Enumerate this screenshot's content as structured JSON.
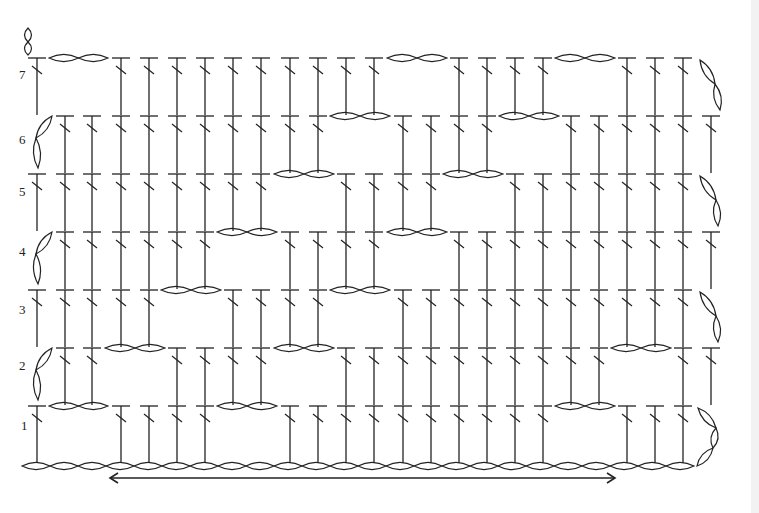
{
  "diagram": {
    "type": "crochet-stitch-chart",
    "stroke_color": "#222222",
    "background": "#ffffff",
    "columns": 25,
    "column_x": [
      37,
      65,
      92,
      121,
      149,
      177,
      205,
      233,
      261,
      290,
      318,
      346,
      374,
      403,
      431,
      459,
      487,
      515,
      543,
      571,
      599,
      627,
      655,
      683,
      711
    ],
    "foundation_chain": {
      "y": 466,
      "loops": 24,
      "x_start": 22,
      "loop_width": 28
    },
    "direction_arrow": {
      "y": 478,
      "x_start": 110,
      "x_end": 615,
      "heads": "both"
    },
    "rows": [
      {
        "number": "1",
        "top": 406,
        "turn": "right",
        "chains": [
          [
            1,
            2
          ],
          [
            7,
            8
          ],
          [
            19,
            20
          ]
        ],
        "stitches_end": 23
      },
      {
        "number": "2",
        "top": 348,
        "turn": "left",
        "chains": [
          [
            3,
            4
          ],
          [
            9,
            10
          ],
          [
            21,
            22
          ]
        ],
        "stitches_end": 24
      },
      {
        "number": "3",
        "top": 290,
        "turn": "right",
        "chains": [
          [
            5,
            6
          ],
          [
            11,
            12
          ]
        ],
        "stitches_end": 23
      },
      {
        "number": "4",
        "top": 232,
        "turn": "left",
        "chains": [
          [
            7,
            8
          ],
          [
            13,
            14
          ]
        ],
        "stitches_end": 24
      },
      {
        "number": "5",
        "top": 174,
        "turn": "right",
        "chains": [
          [
            9,
            10
          ],
          [
            15,
            16
          ]
        ],
        "stitches_end": 23
      },
      {
        "number": "6",
        "top": 116,
        "turn": "left",
        "chains": [
          [
            11,
            12
          ],
          [
            17,
            18
          ]
        ],
        "stitches_end": 24
      },
      {
        "number": "7",
        "top": 58,
        "turn": "right",
        "chains": [
          [
            1,
            2
          ],
          [
            13,
            14
          ],
          [
            19,
            20
          ]
        ],
        "stitches_end": 23
      }
    ]
  },
  "labels": {
    "row1": "1",
    "row2": "2",
    "row3": "3",
    "row4": "4",
    "row5": "5",
    "row6": "6",
    "row7": "7"
  }
}
